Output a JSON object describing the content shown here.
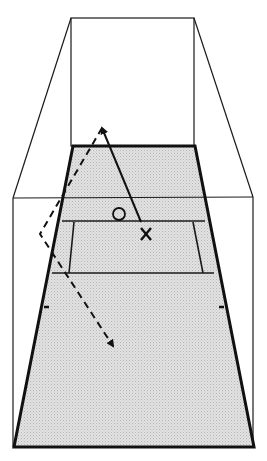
{
  "diagram": {
    "colors": {
      "line": "#111111",
      "floor_fill": "#d6d6d6",
      "background": "#ffffff"
    },
    "markers": {
      "player_o_label": "O",
      "player_x_label": "X"
    },
    "shots": [
      {
        "name": "straight-shot",
        "style": "solid",
        "from": [
          141,
          222
        ],
        "to": [
          102,
          126
        ]
      },
      {
        "name": "ceiling-wall-shot",
        "style": "dashed",
        "path": [
          [
            102,
            126
          ],
          [
            40,
            234
          ],
          [
            113,
            348
          ]
        ]
      }
    ]
  }
}
